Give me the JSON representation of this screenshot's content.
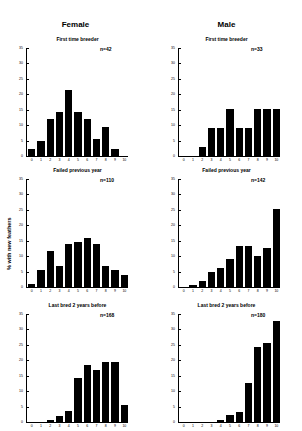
{
  "columns": {
    "left": "Female",
    "right": "Male"
  },
  "ylabel": "% with new feathers",
  "chart_data": [
    {
      "type": "bar",
      "sex": "Female",
      "title": "First time breeder",
      "n_label": "n=42",
      "categories": [
        "0",
        "1",
        "2",
        "3",
        "4",
        "5",
        "6",
        "7",
        "8",
        "9",
        "10"
      ],
      "values": [
        2.4,
        4.8,
        11.9,
        14.3,
        21.4,
        14.3,
        11.9,
        5.5,
        9.5,
        2.4,
        0
      ],
      "ylim": [
        0,
        35
      ],
      "yticks": [
        0,
        5,
        10,
        15,
        20,
        25,
        30,
        35
      ]
    },
    {
      "type": "bar",
      "sex": "Male",
      "title": "First time breeder",
      "n_label": "n=33",
      "categories": [
        "0",
        "1",
        "2",
        "3",
        "4",
        "5",
        "6",
        "7",
        "8",
        "9",
        "10"
      ],
      "values": [
        0,
        0,
        3.0,
        9.1,
        9.1,
        15.2,
        9.1,
        9.1,
        15.2,
        15.2,
        15.2
      ],
      "ylim": [
        0,
        35
      ],
      "yticks": [
        0,
        5,
        10,
        15,
        20,
        25,
        30,
        35
      ]
    },
    {
      "type": "bar",
      "sex": "Female",
      "title": "Failed previous year",
      "n_label": "n=110",
      "categories": [
        "0",
        "1",
        "2",
        "3",
        "4",
        "5",
        "6",
        "7",
        "8",
        "9",
        "10"
      ],
      "values": [
        0.9,
        5.5,
        11.8,
        6.9,
        13.9,
        14.5,
        16.0,
        13.9,
        6.9,
        5.5,
        3.9
      ],
      "ylim": [
        0,
        35
      ],
      "yticks": [
        0,
        5,
        10,
        15,
        20,
        25,
        30,
        35
      ]
    },
    {
      "type": "bar",
      "sex": "Male",
      "title": "Failed previous year",
      "n_label": "n=142",
      "categories": [
        "0",
        "1",
        "2",
        "3",
        "4",
        "5",
        "6",
        "7",
        "8",
        "9",
        "10"
      ],
      "values": [
        0,
        0.7,
        2.1,
        4.9,
        6.3,
        9.2,
        13.4,
        13.4,
        9.9,
        12.7,
        25.4
      ],
      "ylim": [
        0,
        35
      ],
      "yticks": [
        0,
        5,
        10,
        15,
        20,
        25,
        30,
        35
      ]
    },
    {
      "type": "bar",
      "sex": "Female",
      "title": "Last bred 2 years before",
      "n_label": "n=168",
      "categories": [
        "0",
        "1",
        "2",
        "3",
        "4",
        "5",
        "6",
        "7",
        "8",
        "9",
        "10"
      ],
      "values": [
        0,
        0,
        0.6,
        1.8,
        3.6,
        14.3,
        18.5,
        16.7,
        19.6,
        19.6,
        5.4
      ],
      "ylim": [
        0,
        35
      ],
      "yticks": [
        0,
        5,
        10,
        15,
        20,
        25,
        30,
        35
      ]
    },
    {
      "type": "bar",
      "sex": "Male",
      "title": "Last bred 2 years before",
      "n_label": "n=180",
      "categories": [
        "0",
        "1",
        "2",
        "3",
        "4",
        "5",
        "6",
        "7",
        "8",
        "9",
        "10"
      ],
      "values": [
        0,
        0,
        0,
        0,
        0.6,
        2.2,
        3.3,
        12.8,
        24.4,
        25.6,
        32.8
      ],
      "ylim": [
        0,
        35
      ],
      "yticks": [
        0,
        5,
        10,
        15,
        20,
        25,
        30,
        35
      ]
    }
  ]
}
